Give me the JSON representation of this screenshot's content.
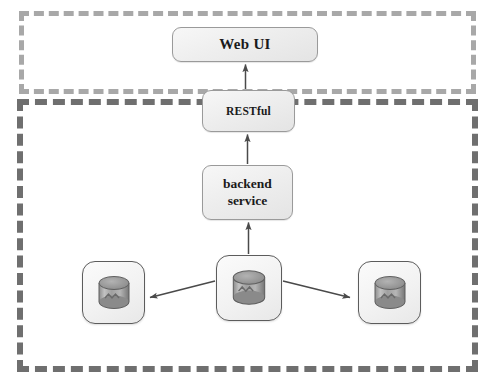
{
  "diagram": {
    "boundaries": [
      {
        "id": "client-tier",
        "name": "client-tier-boundary",
        "style": "dashed",
        "color": "#a8a8a8",
        "label": ""
      },
      {
        "id": "server-tier",
        "name": "server-tier-boundary",
        "style": "dashed",
        "color": "#6f6f6f",
        "label": ""
      }
    ],
    "nodes": {
      "webui": {
        "label": "Web UI",
        "shape": "rounded-rect"
      },
      "restful": {
        "label": "RESTful",
        "shape": "rounded-rect"
      },
      "backend": {
        "label_line1": "backend",
        "label_line2": "service",
        "shape": "rounded-rect"
      },
      "db_left": {
        "label": "",
        "icon": "database-cylinder-icon"
      },
      "db_center": {
        "label": "",
        "icon": "database-cylinder-icon"
      },
      "db_right": {
        "label": "",
        "icon": "database-cylinder-icon"
      }
    },
    "edges": [
      {
        "from": "restful",
        "to": "webui",
        "direction": "up",
        "label": ""
      },
      {
        "from": "backend",
        "to": "restful",
        "direction": "up",
        "label": ""
      },
      {
        "from": "db_center",
        "to": "backend",
        "direction": "up",
        "label": ""
      },
      {
        "from": "db_center",
        "to": "db_left",
        "direction": "left",
        "label": ""
      },
      {
        "from": "db_center",
        "to": "db_right",
        "direction": "right",
        "label": ""
      }
    ],
    "colors": {
      "box_border": "#9a9a9a",
      "box_fill": "#eeeeee",
      "arrow": "#4a4a4a",
      "boundary_light": "#a8a8a8",
      "boundary_dark": "#6f6f6f",
      "text": "#1a1a1a",
      "background": "#ffffff"
    }
  }
}
